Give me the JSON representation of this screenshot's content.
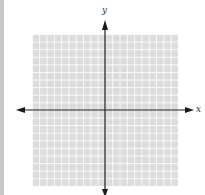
{
  "diagram": {
    "type": "coordinate-plane",
    "grid": {
      "columns": 20,
      "rows": 20,
      "fill_color": "#dcdcdc",
      "line_color": "#ffffff"
    },
    "axes": {
      "x_label": "x",
      "y_label": "y",
      "axis_color": "#1a1a1a"
    }
  }
}
